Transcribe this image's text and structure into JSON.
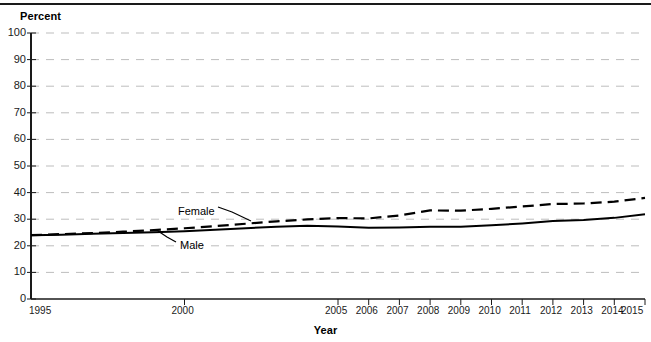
{
  "chart_data": {
    "type": "line",
    "title": "",
    "xlabel": "Year",
    "ylabel": "Percent",
    "xlim": [
      1995,
      2015
    ],
    "ylim": [
      0,
      100
    ],
    "grid": true,
    "legend_position": "inline-annotation",
    "x": [
      1995,
      1996,
      1997,
      1998,
      1999,
      2000,
      2001,
      2002,
      2003,
      2004,
      2005,
      2006,
      2007,
      2008,
      2009,
      2010,
      2011,
      2012,
      2013,
      2014,
      2015
    ],
    "series": [
      {
        "name": "Female",
        "style": "dashed",
        "color": "#000000",
        "values": [
          24.0,
          24.4,
          24.8,
          25.3,
          25.9,
          26.6,
          27.4,
          28.3,
          29.2,
          29.9,
          30.4,
          30.3,
          31.4,
          33.3,
          33.2,
          33.9,
          34.8,
          35.7,
          35.9,
          36.6,
          38.0
        ]
      },
      {
        "name": "Male",
        "style": "solid",
        "color": "#000000",
        "values": [
          24.0,
          24.2,
          24.5,
          24.8,
          25.1,
          25.5,
          26.0,
          26.6,
          27.2,
          27.5,
          27.3,
          26.8,
          26.9,
          27.2,
          27.2,
          27.7,
          28.4,
          29.3,
          29.7,
          30.5,
          31.9
        ]
      }
    ],
    "y_ticks": [
      0,
      10,
      20,
      30,
      40,
      50,
      60,
      70,
      80,
      90,
      100
    ],
    "x_ticks": [
      1995,
      2000,
      2005,
      2006,
      2007,
      2008,
      2009,
      2010,
      2011,
      2012,
      2013,
      2014,
      2015
    ],
    "x_tick_marks": [
      2000,
      2005,
      2006,
      2007,
      2008,
      2009,
      2010,
      2011,
      2012,
      2013,
      2014,
      2015
    ],
    "annotations": [
      {
        "text": "Female",
        "x_px": 178,
        "y_px": 206
      },
      {
        "text": "Male",
        "x_px": 180,
        "y_px": 240
      }
    ],
    "colors": {
      "gridline": "#bdbdbd",
      "axis": "#1a1a1a",
      "series": "#000000",
      "background": "#ffffff"
    }
  }
}
